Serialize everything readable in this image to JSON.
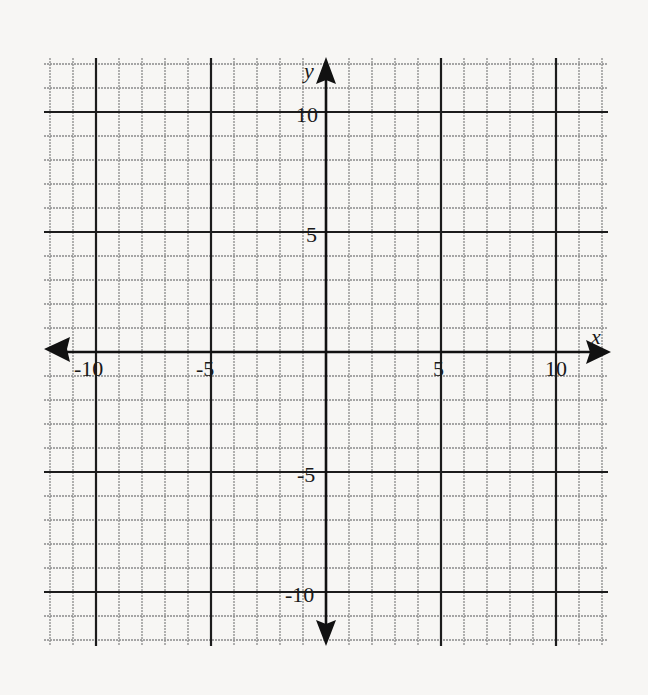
{
  "diagram": {
    "type": "coordinate-plane",
    "x_range": [
      -12,
      12
    ],
    "y_range": [
      -12,
      12
    ],
    "grid_step": 1,
    "major_step": 5,
    "axes": {
      "x_label": "x",
      "y_label": "y"
    },
    "x_tick_labels": [
      {
        "value": -10,
        "text": "-10"
      },
      {
        "value": -5,
        "text": "-5"
      },
      {
        "value": 5,
        "text": "5"
      },
      {
        "value": 10,
        "text": "10"
      }
    ],
    "y_tick_labels": [
      {
        "value": 10,
        "text": "10"
      },
      {
        "value": 5,
        "text": "5"
      },
      {
        "value": -5,
        "text": "-5"
      },
      {
        "value": -10,
        "text": "-10"
      }
    ],
    "colors": {
      "background": "#f7f6f4",
      "minor_grid": "#8a8a8a",
      "major_grid": "#1c1c1c",
      "axis": "#111111"
    }
  }
}
